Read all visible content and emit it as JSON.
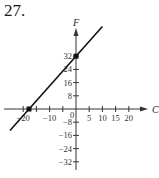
{
  "problem_number": "27.",
  "chart_data": {
    "type": "line",
    "title": "",
    "xlabel": "C",
    "ylabel": "F",
    "x_ticks": [
      -20,
      -10,
      0,
      5,
      10,
      15,
      20
    ],
    "x_tick_labels": [
      "-20",
      "-10",
      "0",
      "5",
      "10",
      "15",
      "20"
    ],
    "y_ticks": [
      32,
      24,
      16,
      8,
      -8,
      -16,
      -24,
      -32
    ],
    "y_tick_labels": [
      "32",
      "24",
      "16",
      "8",
      "-8",
      "-16",
      "-24",
      "-32"
    ],
    "xlim": [
      -25,
      25
    ],
    "ylim": [
      -36,
      48
    ],
    "grid": false,
    "series": [
      {
        "name": "F = (9/5)C + 32",
        "x": [
          -25,
          0,
          10
        ],
        "y": [
          -13,
          32,
          50
        ]
      }
    ],
    "points": [
      {
        "x": -17.8,
        "y": 0
      },
      {
        "x": 0,
        "y": 32
      }
    ]
  }
}
